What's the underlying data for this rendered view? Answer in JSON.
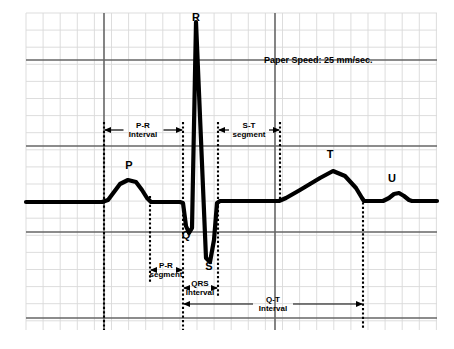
{
  "figure": {
    "name": "ecg-waveform-diagram",
    "background_color": "#ffffff",
    "trace_color": "#000000",
    "grid_minor_color": "#d9d9d9",
    "grid_major_color": "#666666",
    "guide_color": "#000000"
  },
  "notes": {
    "paper_speed": "Paper Speed: 25 mm/sec."
  },
  "wave_labels": [
    {
      "id": "p-wave-label",
      "text": "P",
      "x": 129,
      "y": 169
    },
    {
      "id": "q-wave-label",
      "text": "Q",
      "x": 186,
      "y": 239
    },
    {
      "id": "r-wave-label",
      "text": "R",
      "x": 196,
      "y": 21
    },
    {
      "id": "s-wave-label",
      "text": "S",
      "x": 209,
      "y": 270
    },
    {
      "id": "t-wave-label",
      "text": "T",
      "x": 330,
      "y": 158
    },
    {
      "id": "u-wave-label",
      "text": "U",
      "x": 392,
      "y": 182
    }
  ],
  "annotations": [
    {
      "id": "pr-interval",
      "line1": "P-R",
      "line2": "Interval",
      "x1": 104,
      "x2": 183,
      "y": 130,
      "text_x": 143,
      "text_y1": 128,
      "text_y2": 137
    },
    {
      "id": "st-segment",
      "line1": "S-T",
      "line2": "segment",
      "x1": 218,
      "x2": 280,
      "y": 130,
      "text_x": 249,
      "text_y1": 128,
      "text_y2": 137
    },
    {
      "id": "pr-segment",
      "line1": "P-R",
      "line2": "segment",
      "x1": 150,
      "x2": 183,
      "y": 270,
      "text_x": 166,
      "text_y1": 268,
      "text_y2": 277
    },
    {
      "id": "qrs-interval",
      "line1": "QRS",
      "line2": "Interval",
      "x1": 183,
      "x2": 218,
      "y": 288,
      "text_x": 200,
      "text_y1": 286,
      "text_y2": 295
    },
    {
      "id": "qt-interval",
      "line1": "Q-T",
      "line2": "Interval",
      "x1": 183,
      "x2": 363,
      "y": 304,
      "text_x": 273,
      "text_y1": 302,
      "text_y2": 311
    }
  ],
  "guide_lines": [
    {
      "id": "guide-p-onset",
      "x": 104,
      "y1": 122,
      "y2": 330
    },
    {
      "id": "guide-p-offset",
      "x": 150,
      "y1": 196,
      "y2": 282
    },
    {
      "id": "guide-qrs-onset",
      "x": 183,
      "y1": 122,
      "y2": 330
    },
    {
      "id": "guide-qrs-offset",
      "x": 218,
      "y1": 122,
      "y2": 296
    },
    {
      "id": "guide-st-end",
      "x": 280,
      "y1": 122,
      "y2": 200
    },
    {
      "id": "guide-qt-end",
      "x": 363,
      "y1": 198,
      "y2": 330
    }
  ],
  "chart_data": {
    "type": "line",
    "xlabel": "",
    "ylabel": "",
    "grid": {
      "left": 26,
      "top": 13,
      "right": 437,
      "bottom": 330,
      "minor_step_px": 17.1,
      "major_every": 5,
      "major_x_px": [
        104,
        275
      ],
      "major_y_px": [
        60,
        146,
        232,
        318
      ]
    },
    "legend": null,
    "paper_speed_mm_per_sec": 25,
    "baseline_y_px": 202,
    "series": [
      {
        "name": "ECG trace",
        "points_px": [
          [
            26,
            202
          ],
          [
            102,
            202
          ],
          [
            108,
            200
          ],
          [
            114,
            192
          ],
          [
            120,
            184
          ],
          [
            128,
            180
          ],
          [
            136,
            182
          ],
          [
            142,
            190
          ],
          [
            147,
            198
          ],
          [
            151,
            202
          ],
          [
            180,
            202
          ],
          [
            183,
            203
          ],
          [
            186,
            226
          ],
          [
            189,
            233
          ],
          [
            192,
            228
          ],
          [
            196,
            22
          ],
          [
            206,
            258
          ],
          [
            210,
            262
          ],
          [
            214,
            240
          ],
          [
            217,
            203
          ],
          [
            220,
            201
          ],
          [
            279,
            201
          ],
          [
            286,
            198
          ],
          [
            300,
            190
          ],
          [
            320,
            178
          ],
          [
            333,
            171
          ],
          [
            345,
            176
          ],
          [
            356,
            188
          ],
          [
            362,
            198
          ],
          [
            364,
            201
          ],
          [
            383,
            201
          ],
          [
            389,
            198
          ],
          [
            394,
            194
          ],
          [
            399,
            193
          ],
          [
            404,
            196
          ],
          [
            409,
            200
          ],
          [
            412,
            201
          ],
          [
            437,
            201
          ]
        ]
      }
    ],
    "waves": [
      {
        "label": "P",
        "description": "atrial depolarization, rounded positive bump",
        "peak_px": [
          132,
          180
        ]
      },
      {
        "label": "Q",
        "description": "small negative deflection before R",
        "peak_px": [
          189,
          233
        ]
      },
      {
        "label": "R",
        "description": "tall positive spike, ventricular depolarization",
        "peak_px": [
          196,
          22
        ]
      },
      {
        "label": "S",
        "description": "negative deflection after R",
        "peak_px": [
          210,
          262
        ]
      },
      {
        "label": "T",
        "description": "ventricular repolarization, broad positive wave",
        "peak_px": [
          333,
          171
        ]
      },
      {
        "label": "U",
        "description": "small positive bump after T",
        "peak_px": [
          399,
          193
        ]
      }
    ],
    "intervals": [
      {
        "label": "P-R Interval",
        "from_px": 104,
        "to_px": 183
      },
      {
        "label": "P-R segment",
        "from_px": 150,
        "to_px": 183
      },
      {
        "label": "QRS Interval",
        "from_px": 183,
        "to_px": 218
      },
      {
        "label": "S-T segment",
        "from_px": 218,
        "to_px": 280
      },
      {
        "label": "Q-T Interval",
        "from_px": 183,
        "to_px": 363
      }
    ]
  }
}
